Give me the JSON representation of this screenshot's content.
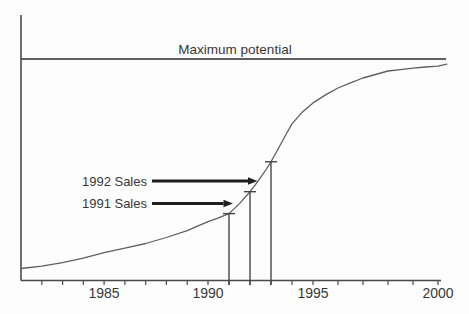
{
  "figure": {
    "background_color": "#fdfdfd",
    "axis_color": "#4a4a4a",
    "curve_color": "#5f5f5f",
    "marker_line_color": "#454545",
    "text_color": "#383838",
    "arrow_color": "#1f1f1f"
  },
  "chart_data": {
    "type": "line",
    "title": "",
    "max_line_label": "Maximum potential",
    "max_potential_value": 1.0,
    "xlabel": "",
    "ylabel": "",
    "grid": false,
    "x_axis": {
      "range": [
        1981,
        2000.4
      ],
      "tick_years": [
        1982,
        1983,
        1984,
        1985,
        1986,
        1987,
        1988,
        1989,
        1990,
        1991,
        1992,
        1993,
        1994,
        1995,
        1996,
        1997,
        1998,
        1999,
        2000
      ],
      "labeled_ticks": [
        {
          "year": 1985,
          "label": "1985"
        },
        {
          "year": 1990,
          "label": "1990"
        },
        {
          "year": 1995,
          "label": "1995"
        },
        {
          "year": 2000,
          "label": "2000"
        }
      ]
    },
    "y_axis": {
      "min": 0,
      "max": 1,
      "unit": "fraction of maximum potential"
    },
    "series": [
      {
        "name": "Sales (fraction of maximum potential)",
        "points": [
          [
            1981,
            0.054
          ],
          [
            1982,
            0.065
          ],
          [
            1983,
            0.081
          ],
          [
            1984,
            0.101
          ],
          [
            1985,
            0.126
          ],
          [
            1986,
            0.146
          ],
          [
            1987,
            0.167
          ],
          [
            1988,
            0.194
          ],
          [
            1989,
            0.225
          ],
          [
            1990,
            0.266
          ],
          [
            1990.5,
            0.283
          ],
          [
            1991,
            0.302
          ],
          [
            1991.5,
            0.347
          ],
          [
            1992,
            0.401
          ],
          [
            1992.25,
            0.432
          ],
          [
            1992.5,
            0.464
          ],
          [
            1992.75,
            0.499
          ],
          [
            1993,
            0.536
          ],
          [
            1993.25,
            0.579
          ],
          [
            1993.5,
            0.622
          ],
          [
            1993.75,
            0.666
          ],
          [
            1994,
            0.707
          ],
          [
            1994.5,
            0.761
          ],
          [
            1995,
            0.802
          ],
          [
            1995.5,
            0.838
          ],
          [
            1996,
            0.869
          ],
          [
            1996.5,
            0.892
          ],
          [
            1997,
            0.914
          ],
          [
            1997.5,
            0.93
          ],
          [
            1998,
            0.946
          ],
          [
            1998.5,
            0.952
          ],
          [
            1999,
            0.959
          ],
          [
            1999.5,
            0.964
          ],
          [
            2000,
            0.968
          ],
          [
            2000.35,
            0.977
          ]
        ]
      }
    ],
    "markers": [
      {
        "label": "1991 Sales",
        "year": 1991,
        "value": 0.302
      },
      {
        "label": "1992 Sales",
        "year": 1992,
        "value": 0.401
      },
      {
        "label": "",
        "year": 1993,
        "value": 0.536
      }
    ],
    "layout": {
      "x_anchors_px": [
        [
          1981,
          21
        ],
        [
          1990,
          208
        ],
        [
          1995,
          313
        ],
        [
          2000,
          438
        ]
      ],
      "y_zero_px": 280.5,
      "y_max_px": 59,
      "y_axis_top_px": 15,
      "x_axis_end_px": 441,
      "max_line_end_px": 446,
      "tick_length_px": 4.5,
      "cap_half_width_px": 6
    }
  }
}
